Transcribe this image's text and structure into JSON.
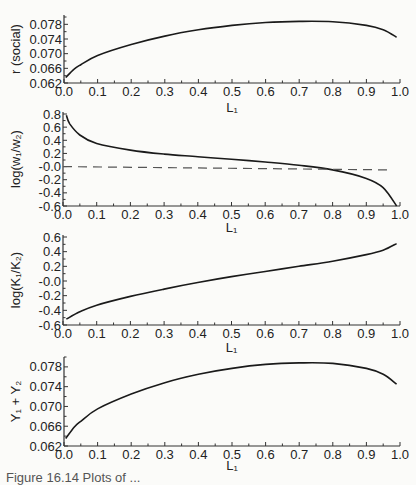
{
  "caption": "Figure 16.14 Plots of ...",
  "chart_data": [
    {
      "type": "line",
      "title": "",
      "xlabel": "L1",
      "ylabel": "r (social)",
      "xlim": [
        0.0,
        1.0
      ],
      "ylim": [
        0.062,
        0.08
      ],
      "xticks": [
        "0.0",
        "0.1",
        "0.2",
        "0.3",
        "0.4",
        "0.5",
        "0.6",
        "0.7",
        "0.8",
        "0.9",
        "1.0"
      ],
      "yticks": [
        "0.062",
        "0.066",
        "0.070",
        "0.074",
        "0.078"
      ],
      "grid": false,
      "x": [
        0.005,
        0.03,
        0.05,
        0.1,
        0.2,
        0.3,
        0.4,
        0.5,
        0.6,
        0.7,
        0.8,
        0.9,
        0.95,
        0.99
      ],
      "series": [
        {
          "name": "r (social)",
          "values": [
            0.0635,
            0.0658,
            0.067,
            0.0695,
            0.0725,
            0.0748,
            0.0765,
            0.0777,
            0.0785,
            0.0788,
            0.0787,
            0.0777,
            0.0765,
            0.0745
          ]
        }
      ]
    },
    {
      "type": "line",
      "title": "",
      "xlabel": "L1",
      "ylabel": "log(w1/w2)",
      "xlim": [
        0.0,
        1.0
      ],
      "ylim": [
        -0.6,
        0.8
      ],
      "xticks": [
        "0.0",
        "0.1",
        "0.2",
        "0.3",
        "0.4",
        "0.5",
        "0.6",
        "0.7",
        "0.8",
        "0.9",
        "1.0"
      ],
      "yticks": [
        "0.8",
        "0.6",
        "0.4",
        "0.2",
        "-0.0",
        "-0.2",
        "-0.4",
        "-0.6"
      ],
      "grid": false,
      "x": [
        0.01,
        0.02,
        0.05,
        0.1,
        0.2,
        0.3,
        0.4,
        0.5,
        0.6,
        0.7,
        0.8,
        0.9,
        0.95,
        0.99
      ],
      "series": [
        {
          "name": "log(w1/w2)",
          "values": [
            0.78,
            0.65,
            0.48,
            0.35,
            0.25,
            0.19,
            0.15,
            0.11,
            0.07,
            0.02,
            -0.05,
            -0.18,
            -0.32,
            -0.6
          ]
        },
        {
          "name": "reference (dashed)",
          "style": "dashed",
          "values_x": [
            0.0,
            0.97
          ],
          "values": [
            0.0,
            -0.05
          ]
        }
      ]
    },
    {
      "type": "line",
      "title": "",
      "xlabel": "L1",
      "ylabel": "log(K1/K2)",
      "xlim": [
        0.0,
        1.0
      ],
      "ylim": [
        -0.6,
        0.6
      ],
      "xticks": [
        "0.0",
        "0.1",
        "0.2",
        "0.3",
        "0.4",
        "0.5",
        "0.6",
        "0.7",
        "0.8",
        "0.9",
        "1.0"
      ],
      "yticks": [
        "0.6",
        "0.4",
        "0.2",
        "-0.0",
        "-0.2",
        "-0.4",
        "-0.6"
      ],
      "grid": false,
      "x": [
        0.01,
        0.05,
        0.1,
        0.2,
        0.3,
        0.4,
        0.5,
        0.6,
        0.7,
        0.8,
        0.9,
        0.95,
        0.99
      ],
      "series": [
        {
          "name": "log(K1/K2)",
          "values": [
            -0.52,
            -0.42,
            -0.33,
            -0.21,
            -0.11,
            -0.02,
            0.06,
            0.13,
            0.2,
            0.27,
            0.36,
            0.42,
            0.51
          ]
        }
      ]
    },
    {
      "type": "line",
      "title": "",
      "xlabel": "L1",
      "ylabel": "Y1 + Y2",
      "xlim": [
        0.0,
        1.0
      ],
      "ylim": [
        0.062,
        0.08
      ],
      "xticks": [
        "0.0",
        "0.1",
        "0.2",
        "0.3",
        "0.4",
        "0.5",
        "0.6",
        "0.7",
        "0.8",
        "0.9",
        "1.0"
      ],
      "yticks": [
        "0.062",
        "0.066",
        "0.070",
        "0.074",
        "0.078"
      ],
      "grid": false,
      "x": [
        0.005,
        0.03,
        0.05,
        0.1,
        0.2,
        0.3,
        0.4,
        0.5,
        0.6,
        0.7,
        0.8,
        0.9,
        0.95,
        0.99
      ],
      "series": [
        {
          "name": "Y1 + Y2",
          "values": [
            0.0635,
            0.0658,
            0.067,
            0.0695,
            0.0725,
            0.0748,
            0.0765,
            0.0777,
            0.0785,
            0.0788,
            0.0787,
            0.0777,
            0.0765,
            0.0745
          ]
        }
      ]
    }
  ],
  "panels": [
    {
      "ylabel": "r (social)",
      "xlabel": "L₁"
    },
    {
      "ylabel": "log(w₁/w₂)",
      "xlabel": "L₁"
    },
    {
      "ylabel": "log(K₁/K₂)",
      "xlabel": "L₁"
    },
    {
      "ylabel": "Y₁ + Y₂",
      "xlabel": "L₁"
    }
  ],
  "style": {
    "line_color": "#1a1a1a",
    "axis_color": "#333333",
    "background": "#fbfbf9"
  }
}
